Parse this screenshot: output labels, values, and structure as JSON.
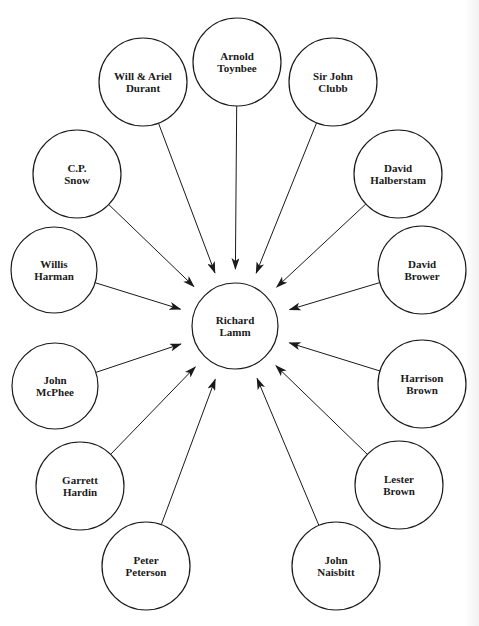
{
  "diagram": {
    "type": "radial-influence",
    "center": {
      "id": "lamm",
      "lines": [
        "Richard",
        "Lamm"
      ],
      "x": 235,
      "y": 326,
      "r": 43
    },
    "nodes": [
      {
        "id": "toynbee",
        "lines": [
          "Arnold",
          "Toynbee"
        ],
        "x": 237,
        "y": 62,
        "r": 44
      },
      {
        "id": "durant",
        "lines": [
          "Will & Ariel",
          "Durant"
        ],
        "x": 143,
        "y": 82,
        "r": 44
      },
      {
        "id": "clubb",
        "lines": [
          "Sir John",
          "Clubb"
        ],
        "x": 333,
        "y": 82,
        "r": 44
      },
      {
        "id": "snow",
        "lines": [
          "C.P.",
          "Snow"
        ],
        "x": 77,
        "y": 174,
        "r": 44
      },
      {
        "id": "halberstam",
        "lines": [
          "David",
          "Halberstam"
        ],
        "x": 398,
        "y": 174,
        "r": 44
      },
      {
        "id": "harman",
        "lines": [
          "Willis",
          "Harman"
        ],
        "x": 54,
        "y": 270,
        "r": 43
      },
      {
        "id": "brower",
        "lines": [
          "David",
          "Brower"
        ],
        "x": 422,
        "y": 270,
        "r": 44
      },
      {
        "id": "mcphee",
        "lines": [
          "John",
          "McPhee"
        ],
        "x": 55,
        "y": 386,
        "r": 43
      },
      {
        "id": "hbrown",
        "lines": [
          "Harrison",
          "Brown"
        ],
        "x": 422,
        "y": 384,
        "r": 44
      },
      {
        "id": "hardin",
        "lines": [
          "Garrett",
          "Hardin"
        ],
        "x": 80,
        "y": 486,
        "r": 44
      },
      {
        "id": "lbrown",
        "lines": [
          "Lester",
          "Brown"
        ],
        "x": 399,
        "y": 485,
        "r": 44
      },
      {
        "id": "peterson",
        "lines": [
          "Peter",
          "Peterson"
        ],
        "x": 146,
        "y": 566,
        "r": 44
      },
      {
        "id": "naisbitt",
        "lines": [
          "John",
          "Naisbitt"
        ],
        "x": 336,
        "y": 566,
        "r": 44
      }
    ],
    "edges": [
      {
        "from": "toynbee",
        "to": "lamm"
      },
      {
        "from": "durant",
        "to": "lamm"
      },
      {
        "from": "clubb",
        "to": "lamm"
      },
      {
        "from": "snow",
        "to": "lamm"
      },
      {
        "from": "halberstam",
        "to": "lamm"
      },
      {
        "from": "harman",
        "to": "lamm"
      },
      {
        "from": "brower",
        "to": "lamm"
      },
      {
        "from": "mcphee",
        "to": "lamm"
      },
      {
        "from": "hbrown",
        "to": "lamm"
      },
      {
        "from": "hardin",
        "to": "lamm"
      },
      {
        "from": "lbrown",
        "to": "lamm"
      },
      {
        "from": "peterson",
        "to": "lamm"
      },
      {
        "from": "naisbitt",
        "to": "lamm"
      }
    ],
    "arrow_gap": 14,
    "colors": {
      "stroke": "#1a1a1a",
      "fill": "#ffffff",
      "text": "#1a1a1a"
    }
  }
}
